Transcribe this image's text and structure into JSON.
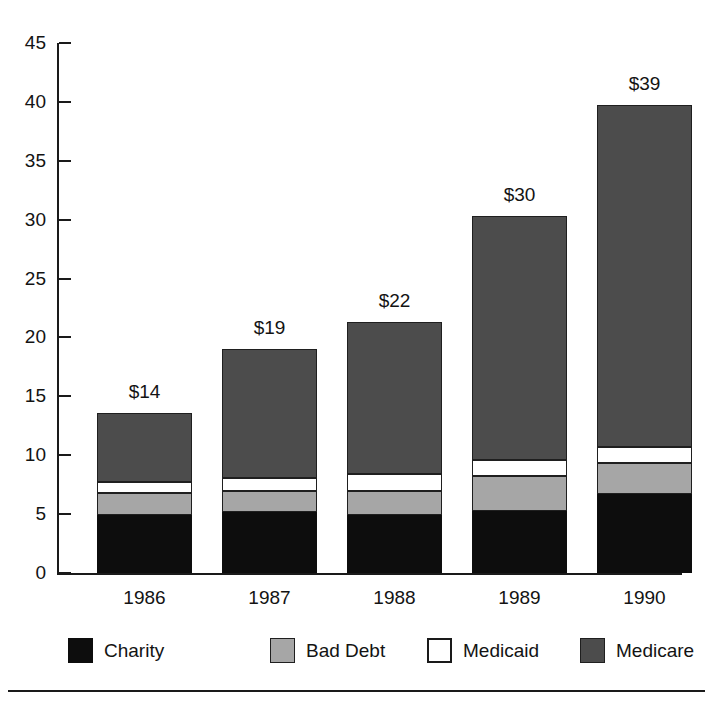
{
  "chart_data": {
    "type": "bar",
    "subtype": "stacked-vertical",
    "title": "",
    "xlabel": "",
    "ylabel": "",
    "categories": [
      "1986",
      "1987",
      "1988",
      "1989",
      "1990"
    ],
    "ylim": [
      0,
      45
    ],
    "yticks": [
      0,
      5,
      10,
      15,
      20,
      25,
      30,
      35,
      40,
      45
    ],
    "ytick_labels": [
      "0",
      "5",
      "10",
      "15",
      "20",
      "25",
      "30",
      "35",
      "40",
      "45"
    ],
    "grid": false,
    "legend_position": "bottom",
    "series": [
      {
        "name": "Charity",
        "color": "#0d0d0d",
        "values": [
          4.9,
          5.2,
          4.9,
          5.3,
          6.7
        ]
      },
      {
        "name": "Bad Debt",
        "color": "#a6a6a6",
        "values": [
          1.9,
          1.8,
          2.1,
          2.9,
          2.6
        ]
      },
      {
        "name": "Medicaid",
        "color": "#ffffff",
        "values": [
          0.9,
          1.1,
          1.4,
          1.4,
          1.4
        ]
      },
      {
        "name": "Medicare",
        "color": "#4c4c4c",
        "values": [
          5.9,
          10.9,
          12.9,
          20.7,
          29.0
        ]
      }
    ],
    "bar_labels": [
      "$14",
      "$19",
      "$22",
      "$30",
      "$39"
    ],
    "totals": [
      13.6,
      19.0,
      21.3,
      30.3,
      39.7
    ]
  },
  "legend": {
    "items": [
      {
        "label": "Charity",
        "swatch": "charity-swatch"
      },
      {
        "label": "Bad Debt",
        "swatch": "bad-debt-swatch"
      },
      {
        "label": "Medicaid",
        "swatch": "medicaid-swatch"
      },
      {
        "label": "Medicare",
        "swatch": "medicare-swatch"
      }
    ]
  },
  "colors": {
    "charity": "#0d0d0d",
    "bad_debt": "#a6a6a6",
    "medicaid": "#ffffff",
    "medicare": "#4c4c4c",
    "axis": "#1a1a1a",
    "text": "#131313",
    "background": "#ffffff"
  }
}
